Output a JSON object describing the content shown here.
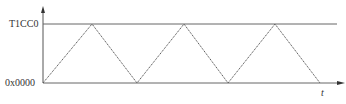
{
  "diagram": {
    "type": "timer-up-down-triangle-waveform",
    "y_axis": {
      "top_label": "T1CC0",
      "bottom_label": "0x0000"
    },
    "x_axis": {
      "label": "t"
    },
    "waveform": {
      "shape": "triangle",
      "points": [
        {
          "x": 43,
          "y": 83
        },
        {
          "x": 92,
          "y": 24
        },
        {
          "x": 137,
          "y": 83
        },
        {
          "x": 184,
          "y": 24
        },
        {
          "x": 228,
          "y": 83
        },
        {
          "x": 275,
          "y": 24
        },
        {
          "x": 320,
          "y": 83
        }
      ],
      "peaks_at_level": "T1CC0",
      "troughs_at_level": "0x0000"
    },
    "colors": {
      "line": "#555555",
      "text": "#333333",
      "background": "#ffffff"
    }
  }
}
